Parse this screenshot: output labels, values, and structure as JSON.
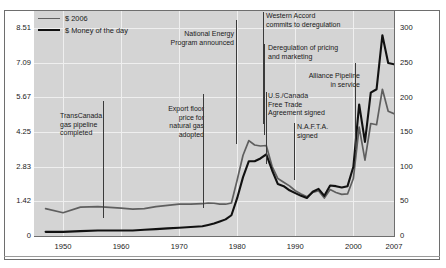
{
  "chart_data": {
    "type": "line",
    "title": "",
    "xlabel": "",
    "ylabel_left": "",
    "ylabel_right": "",
    "grid": true,
    "legend_position": "top-left",
    "xlim": [
      1945,
      2007
    ],
    "ylim_left": [
      0,
      9.2
    ],
    "ylim_right": [
      0,
      325
    ],
    "xticks": [
      "1950",
      "1960",
      "1970",
      "1980",
      "1990",
      "2000",
      "2007"
    ],
    "xtick_values": [
      1950,
      1960,
      1970,
      1980,
      1990,
      2000,
      2007
    ],
    "yticks_left": [
      "0",
      "1.42",
      "2.83",
      "4.25",
      "5.67",
      "7.09",
      "8.51"
    ],
    "ytick_values_left": [
      0,
      1.42,
      2.83,
      4.25,
      5.67,
      7.09,
      8.51
    ],
    "yticks_right": [
      "0",
      "50",
      "100",
      "150",
      "200",
      "250",
      "300"
    ],
    "ytick_values_right": [
      0,
      50,
      100,
      150,
      200,
      250,
      300
    ],
    "series": [
      {
        "name": "$ 2006",
        "color": "#5f5f5f",
        "axis": "left",
        "x": [
          1947,
          1950,
          1953,
          1956,
          1958,
          1960,
          1962,
          1964,
          1966,
          1968,
          1970,
          1972,
          1974,
          1975,
          1976,
          1977,
          1978,
          1979,
          1980,
          1981,
          1982,
          1983,
          1984,
          1985,
          1986,
          1987,
          1988,
          1989,
          1990,
          1991,
          1992,
          1993,
          1994,
          1995,
          1996,
          1997,
          1998,
          1999,
          2000,
          2001,
          2002,
          2003,
          2004,
          2005,
          2006,
          2007
        ],
        "values": [
          1.12,
          0.95,
          1.18,
          1.2,
          1.17,
          1.14,
          1.1,
          1.12,
          1.2,
          1.25,
          1.3,
          1.3,
          1.32,
          1.35,
          1.34,
          1.3,
          1.3,
          1.35,
          2.3,
          3.3,
          3.9,
          3.72,
          3.68,
          3.7,
          2.85,
          2.35,
          2.2,
          2.05,
          1.85,
          1.72,
          1.6,
          1.78,
          1.85,
          1.55,
          1.9,
          1.78,
          1.7,
          1.72,
          2.35,
          4.45,
          3.1,
          4.6,
          4.55,
          6.0,
          5.1,
          5.0
        ]
      },
      {
        "name": "$ Money of the day",
        "color": "#111111",
        "axis": "right",
        "x": [
          1947,
          1950,
          1953,
          1956,
          1958,
          1960,
          1962,
          1964,
          1966,
          1968,
          1970,
          1972,
          1974,
          1975,
          1976,
          1977,
          1978,
          1979,
          1980,
          1981,
          1982,
          1983,
          1984,
          1985,
          1986,
          1987,
          1988,
          1989,
          1990,
          1991,
          1992,
          1993,
          1994,
          1995,
          1996,
          1997,
          1998,
          1999,
          2000,
          2001,
          2002,
          2003,
          2004,
          2005,
          2006,
          2007
        ],
        "values": [
          6,
          6,
          7,
          8,
          8,
          8,
          8,
          9,
          10,
          11,
          12,
          13,
          14,
          16,
          18,
          21,
          24,
          30,
          55,
          85,
          108,
          108,
          112,
          118,
          95,
          75,
          72,
          66,
          62,
          58,
          55,
          64,
          68,
          58,
          73,
          72,
          70,
          72,
          100,
          190,
          136,
          207,
          212,
          290,
          250,
          248
        ]
      }
    ],
    "annotations": [
      {
        "id": "transcanada",
        "text": "TransCanada\ngas pipeline\ncompleted",
        "align": "left",
        "x_label": 60,
        "y_label": 112,
        "leader_x": 103,
        "leader_top": 101,
        "leader_bottom": 218
      },
      {
        "id": "export-floor",
        "text": "Export floor\nprice for\nnatural gas\nadopted",
        "align": "right",
        "x_label": 140,
        "y_label": 105,
        "leader_x": 203,
        "leader_top": 94,
        "leader_bottom": 208
      },
      {
        "id": "national-energy-program",
        "text": "National Energy\nProgram announced",
        "align": "right",
        "x_label": 170,
        "y_label": 30,
        "leader_x": 236,
        "leader_top": 20,
        "leader_bottom": 144
      },
      {
        "id": "western-accord",
        "text": "Western Accord\ncommits to deregulation",
        "align": "left",
        "x_label": 266,
        "y_label": 12,
        "leader_x": 263,
        "leader_top": 12,
        "leader_bottom": 124
      },
      {
        "id": "deregulation-pricing",
        "text": "Deregulation of pricing\nand marketing",
        "align": "left",
        "x_label": 268,
        "y_label": 44,
        "leader_x": 264,
        "leader_top": 44,
        "leader_bottom": 135
      },
      {
        "id": "alliance-pipeline",
        "text": "Alliance Pipeline\nin service",
        "align": "right",
        "x_label": 296,
        "y_label": 72,
        "leader_x": 355,
        "leader_top": 63,
        "leader_bottom": 150
      },
      {
        "id": "us-canada-fta",
        "text": "U.S./Canada\nFree Trade\nAgreement signed",
        "align": "left",
        "x_label": 268,
        "y_label": 92,
        "leader_x": 266,
        "leader_top": 92,
        "leader_bottom": 164
      },
      {
        "id": "nafta",
        "text": "N.A.F.T.A.\nsigned",
        "align": "left",
        "x_label": 297,
        "y_label": 123,
        "leader_x": 294,
        "leader_top": 123,
        "leader_bottom": 180
      }
    ],
    "legend": [
      {
        "label": "$ 2006",
        "color": "#5f5f5f",
        "thickness": 1.6
      },
      {
        "label": "$ Money of the day",
        "color": "#111111",
        "thickness": 2.4
      }
    ]
  },
  "colors": {
    "plot_background": "#d4d4d4",
    "grid": "#efefef",
    "frame": "#6e6e6e",
    "page_background": "#ffffff",
    "text": "#1a1a1a"
  }
}
